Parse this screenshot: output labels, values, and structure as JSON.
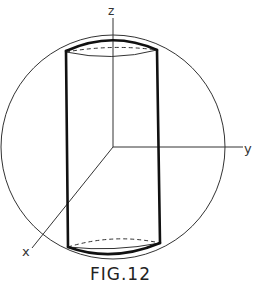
{
  "figure": {
    "caption": "FIG.12",
    "axes": {
      "x_label": "x",
      "y_label": "y",
      "z_label": "z"
    },
    "shapes": [
      "sphere",
      "cylinder inscribed in sphere"
    ]
  }
}
